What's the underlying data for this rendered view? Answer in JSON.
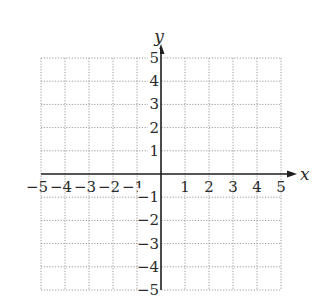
{
  "chart_data": {
    "type": "scatter",
    "title": "",
    "xlabel": "x",
    "ylabel": "y",
    "xlim": [
      -5,
      5
    ],
    "ylim": [
      -5,
      5
    ],
    "grid": true,
    "grid_style": "dotted",
    "x_ticks": [
      -5,
      -4,
      -3,
      -2,
      -1,
      1,
      2,
      3,
      4,
      5
    ],
    "y_ticks": [
      -5,
      -4,
      -3,
      -2,
      -1,
      1,
      2,
      3,
      4,
      5
    ],
    "x_tick_labels": [
      "−5",
      "−4",
      "−3",
      "−2",
      "−1",
      "1",
      "2",
      "3",
      "4",
      "5"
    ],
    "y_tick_labels": [
      "−5",
      "−4",
      "−3",
      "−2",
      "−1",
      "1",
      "2",
      "3",
      "4",
      "5"
    ],
    "series": [],
    "legend": null
  },
  "layout": {
    "origin_px": [
      161,
      174
    ],
    "unit_x_px": 24,
    "unit_y_px": 23.2,
    "grid_color": "#9a9a9a",
    "axis_color": "#1e1e1e"
  }
}
